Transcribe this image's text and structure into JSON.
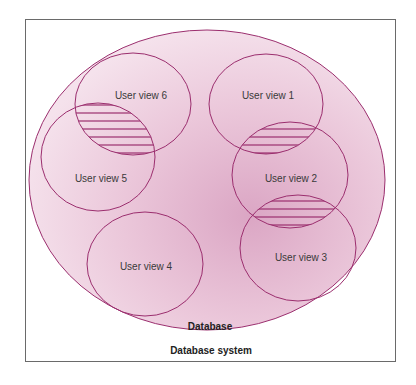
{
  "diagram": {
    "title": "Database system",
    "database_label": "Database",
    "colors": {
      "stroke": "#9b2e6e",
      "fill_light": "#f3dbe8",
      "fill_dark": "#d9a3c2",
      "frame": "#6a6a6a",
      "text": "#3a3a3a"
    },
    "user_views": [
      {
        "id": 1,
        "label": "User view 1"
      },
      {
        "id": 2,
        "label": "User view 2"
      },
      {
        "id": 3,
        "label": "User view 3"
      },
      {
        "id": 4,
        "label": "User view 4"
      },
      {
        "id": 5,
        "label": "User view 5"
      },
      {
        "id": 6,
        "label": "User view 6"
      }
    ],
    "overlaps": [
      {
        "between": [
          "User view 6",
          "User view 5"
        ],
        "style": "hatched"
      },
      {
        "between": [
          "User view 1",
          "User view 2"
        ],
        "style": "hatched"
      },
      {
        "between": [
          "User view 2",
          "User view 3"
        ],
        "style": "hatched"
      }
    ]
  }
}
